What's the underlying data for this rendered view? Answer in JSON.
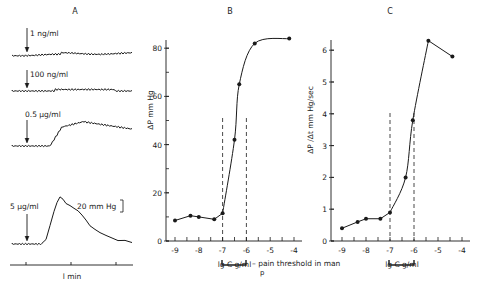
{
  "figure": {
    "panel_a": {
      "label": "A",
      "traces": [
        {
          "dose": "1 ng/ml"
        },
        {
          "dose": "100 ng/ml"
        },
        {
          "dose": "0.5 µg/ml"
        },
        {
          "dose": "5 µg/ml"
        }
      ],
      "scale_bar": "20 mm Hg",
      "time_label": "l min"
    },
    "panel_b": {
      "label": "B"
    },
    "panel_c": {
      "label": "C"
    },
    "pain_threshold_label": "– pain threshold in man",
    "pain_threshold_sub": "p"
  },
  "chart_data": [
    {
      "panel": "B",
      "type": "line",
      "title": "B",
      "xlabel": "lg C  g/ml",
      "ylabel": "ΔP  mm Hg",
      "x_ticks": [
        -9,
        -8,
        -7,
        -6,
        -5,
        -4
      ],
      "y_ticks": [
        0,
        20,
        40,
        60,
        80
      ],
      "xlim": [
        -9.3,
        -3.8
      ],
      "ylim": [
        0,
        85
      ],
      "grid": false,
      "dashed_vlines": [
        -7,
        -6
      ],
      "series": [
        {
          "name": "ΔP",
          "x": [
            -9,
            -8.35,
            -8,
            -7.35,
            -7,
            -6.5,
            -6.3,
            -5.65,
            -4.2
          ],
          "y": [
            8.5,
            10.5,
            10,
            9,
            11.5,
            42,
            65,
            82,
            84
          ]
        }
      ]
    },
    {
      "panel": "C",
      "type": "line",
      "title": "C",
      "xlabel": "lg C  g/ml",
      "ylabel": "ΔP /Δt  mm Hg/sec",
      "x_ticks": [
        -9,
        -8,
        -7,
        -6,
        -5,
        -4
      ],
      "y_ticks": [
        0,
        1,
        2,
        3,
        4,
        5,
        6
      ],
      "xlim": [
        -9.3,
        -3.8
      ],
      "ylim": [
        0,
        6.4
      ],
      "grid": false,
      "dashed_vlines": [
        -7,
        -6
      ],
      "series": [
        {
          "name": "ΔP/Δt",
          "x": [
            -9,
            -8.35,
            -8,
            -7.4,
            -7,
            -6.35,
            -6.05,
            -5.4,
            -4.4
          ],
          "y": [
            0.4,
            0.6,
            0.7,
            0.7,
            0.9,
            2.0,
            3.8,
            6.3,
            5.8
          ]
        }
      ]
    }
  ]
}
